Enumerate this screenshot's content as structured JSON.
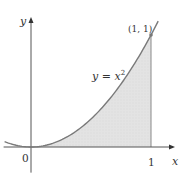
{
  "figure": {
    "function_label": "y = x",
    "function_exponent": "2",
    "point_label": "(1, 1)",
    "x_axis_label": "x",
    "y_axis_label": "y",
    "origin_label": "0",
    "x_tick_label": "1"
  },
  "chart_data": {
    "type": "area",
    "title": "",
    "function": "y = x^2",
    "xlabel": "x",
    "ylabel": "y",
    "x_ticks": [
      "0",
      "1"
    ],
    "shaded_region": {
      "from_x": 0,
      "to_x": 1,
      "under": "y = x^2"
    },
    "marked_point": {
      "x": 1,
      "y": 1,
      "label": "(1, 1)"
    },
    "curve_domain": [
      -0.22,
      1.06
    ],
    "xlim": [
      -0.22,
      1.2
    ],
    "ylim": [
      -0.22,
      1.16
    ],
    "colors": {
      "curve": "#7a7a7a",
      "shade": "#e2e2e2",
      "axis": "#555555"
    }
  }
}
